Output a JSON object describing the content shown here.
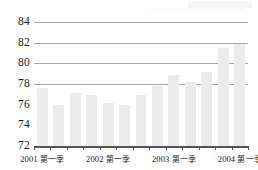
{
  "chart_data": {
    "type": "bar",
    "title": "",
    "subtitle": "",
    "xlabel": "",
    "ylabel": "",
    "ylim": [
      72,
      84
    ],
    "ytick_values": [
      84,
      82,
      80,
      78,
      76,
      74,
      72
    ],
    "ytick_labels": [
      "84",
      "82",
      "80",
      "78",
      "76",
      "74",
      "72"
    ],
    "gridlines_at": [
      84,
      82,
      80,
      78
    ],
    "grid": true,
    "legend": "none",
    "bar_color": "#ebebeb",
    "grid_color": "#a9a9a9",
    "axis_color": "#555555",
    "categories": [
      "2001 第一季",
      "2001 第二季",
      "2001 第三季",
      "2001 第四季",
      "2002 第一季",
      "2002 第二季",
      "2002 第三季",
      "2002 第四季",
      "2003 第一季",
      "2003 第二季",
      "2003 第三季",
      "2003 第四季",
      "2004 第一季"
    ],
    "values": [
      77.6,
      76.0,
      77.1,
      76.9,
      76.2,
      76.0,
      76.9,
      77.8,
      78.9,
      78.2,
      79.2,
      81.5,
      81.9
    ],
    "xtick_labels_visible": [
      {
        "index": 0,
        "year": "2001",
        "quarter": "第一季"
      },
      {
        "index": 4,
        "year": "2002",
        "quarter": "第一季"
      },
      {
        "index": 8,
        "year": "2003",
        "quarter": "第一季"
      },
      {
        "index": 12,
        "year": "2004",
        "quarter": "第一季"
      }
    ]
  }
}
